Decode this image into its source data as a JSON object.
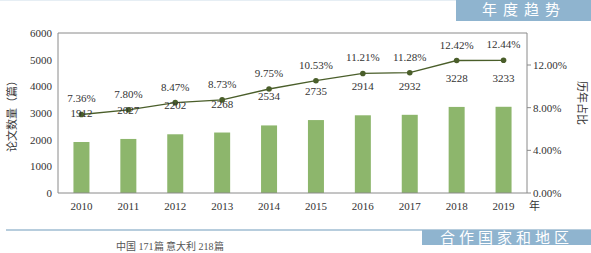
{
  "header": {
    "section_title": "年度趋势",
    "next_section_title": "合作国家和地区",
    "partial_footer_text": "中国 171篇 意大利 218篇"
  },
  "colors": {
    "bar": "#8db66c",
    "line": "#4a5e2a",
    "banner": "#8fb4cf"
  },
  "chart_data": {
    "type": "bar",
    "title": "",
    "categories": [
      "2010",
      "2011",
      "2012",
      "2013",
      "2014",
      "2015",
      "2016",
      "2017",
      "2018",
      "2019"
    ],
    "series": [
      {
        "name": "论文数量（篇）",
        "type": "bar",
        "axis": "left",
        "values": [
          1912,
          2027,
          2202,
          2268,
          2534,
          2735,
          2914,
          2932,
          3228,
          3233
        ],
        "labels": [
          "1912",
          "2027",
          "2202",
          "2268",
          "2534",
          "2735",
          "2914",
          "2932",
          "3228",
          "3233"
        ]
      },
      {
        "name": "历年占比",
        "type": "line",
        "axis": "right",
        "values": [
          7.36,
          7.8,
          8.47,
          8.73,
          9.75,
          10.53,
          11.21,
          11.28,
          12.42,
          12.44
        ],
        "labels": [
          "7.36%",
          "7.80%",
          "8.47%",
          "8.73%",
          "9.75%",
          "10.53%",
          "11.21%",
          "11.28%",
          "12.42%",
          "12.44%"
        ]
      }
    ],
    "xlabel": "年",
    "ylabel": "论文数量（篇）",
    "y2label": "历年占比",
    "ylim": [
      0,
      6000
    ],
    "yticks": [
      "0",
      "1000",
      "2000",
      "3000",
      "4000",
      "5000",
      "6000"
    ],
    "y2lim": [
      0,
      15
    ],
    "y2ticks": [
      "0.00%",
      "4.00%",
      "8.00%",
      "12.00%"
    ],
    "y2tick_values": [
      0,
      4,
      8,
      12
    ],
    "grid": false,
    "legend": "none"
  }
}
